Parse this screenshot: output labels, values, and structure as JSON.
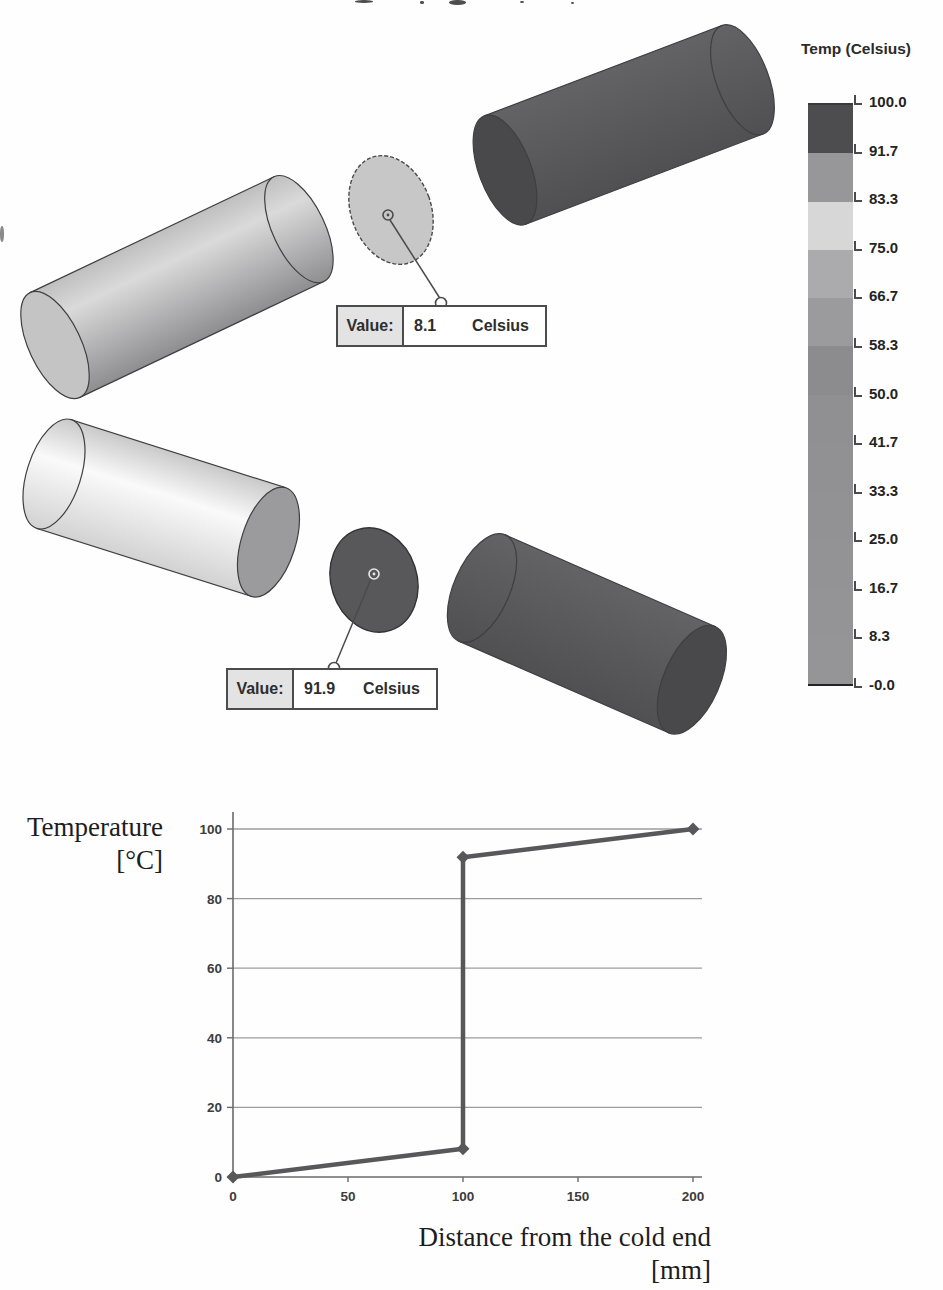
{
  "scene": {
    "legend": {
      "title": "Temp (Celsius)",
      "tick_labels": [
        "100.0",
        "91.7",
        "83.3",
        "75.0",
        "66.7",
        "58.3",
        "50.0",
        "41.7",
        "33.3",
        "25.0",
        "16.7",
        "8.3",
        "-0.0"
      ],
      "segment_colors": [
        "#4d4d50",
        "#97979a",
        "#d7d7d7",
        "#ababae",
        "#9b9b9e",
        "#8c8c8f",
        "#909093",
        "#919194",
        "#929295",
        "#939396",
        "#949497",
        "#959598"
      ]
    },
    "callouts": [
      {
        "label": "Value:",
        "value": "8.1",
        "unit": "Celsius"
      },
      {
        "label": "Value:",
        "value": "91.9",
        "unit": "Celsius"
      }
    ],
    "colors": {
      "hot_body_top": "#636366",
      "hot_body_bottom": "#505053",
      "hot_cap": "#49494c",
      "cold_body_top": "#bfbfbf",
      "cold_body_mid": "#dadada",
      "cold_body_bottom": "#8e8e91",
      "cold_cap": "#c4c4c4",
      "cold2_body_top": "#c9c9c9",
      "cold2_body_mid": "#fafafa",
      "cold2_body_bottom": "#d2d2d2",
      "cold2_cap": "#9b9b9e",
      "disc_cold": "#c7c7c7",
      "disc_hot": "#58585b",
      "outline": "#3f3f42",
      "annotation": "#4a4a4d"
    }
  },
  "chart_data": {
    "type": "line",
    "title": "",
    "x": [
      0,
      100,
      100,
      200
    ],
    "y": [
      0,
      8.1,
      91.9,
      100
    ],
    "xticks": [
      0,
      50,
      100,
      150,
      200
    ],
    "yticks": [
      0,
      20,
      40,
      60,
      80,
      100
    ],
    "xtick_labels": [
      "0",
      "50",
      "100",
      "150",
      "200"
    ],
    "ytick_labels": [
      "0",
      "20",
      "40",
      "60",
      "80",
      "100"
    ],
    "xlim": [
      0,
      200
    ],
    "ylim": [
      0,
      100
    ],
    "xlabel": "Distance from the cold end [mm]",
    "ylabel": "Temperature [°C]",
    "xlabel_lines": [
      "Distance from the cold end",
      "[mm]"
    ],
    "ylabel_lines": [
      "Temperature",
      "[°C]"
    ],
    "grid": true,
    "legend_position": "none",
    "marker": "diamond",
    "line_color": "#58585b",
    "grid_color": "#9c9c9c",
    "axis_color": "#6b6b6b"
  }
}
